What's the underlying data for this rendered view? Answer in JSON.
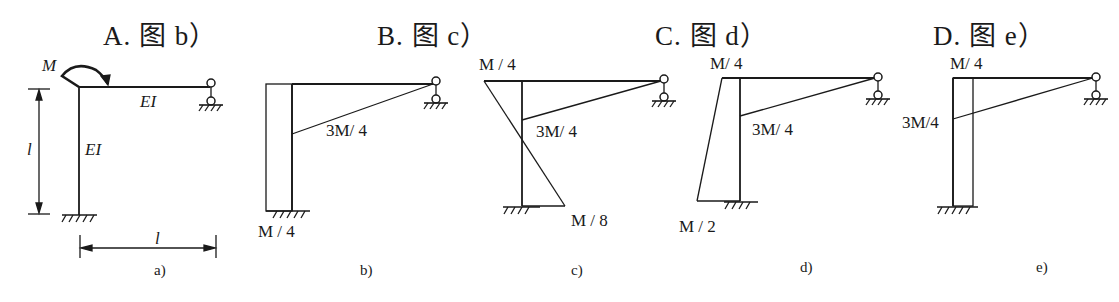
{
  "options": [
    {
      "letter": "A.",
      "text": "图 b）",
      "label": "A. 图 b）"
    },
    {
      "letter": "B.",
      "text": "图 c）",
      "label": "B. 图 c）"
    },
    {
      "letter": "C.",
      "text": "图 d）",
      "label": "C. 图 d）"
    },
    {
      "letter": "D.",
      "text": "图 e）",
      "label": "D. 图 e）"
    }
  ],
  "figures": {
    "a": {
      "caption": "a)",
      "moment": "M",
      "beam_stiffness": "EI",
      "column_stiffness": "EI",
      "height_dim": "l",
      "span_dim": "l"
    },
    "b": {
      "caption": "b)",
      "labels": [
        "3M/ 4",
        "M / 4"
      ]
    },
    "c": {
      "caption": "c)",
      "labels": [
        "M / 4",
        "3M/ 4",
        "M / 8"
      ]
    },
    "d": {
      "caption": "d)",
      "labels": [
        "M/ 4",
        "3M/ 4",
        "M / 2"
      ]
    },
    "e": {
      "caption": "e)",
      "labels": [
        "M/ 4",
        "3M/4"
      ]
    }
  }
}
